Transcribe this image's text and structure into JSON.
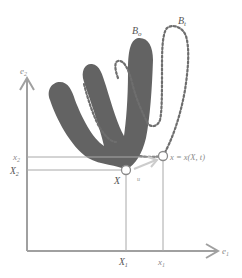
{
  "diagram": {
    "colors": {
      "body_fill": "#636363",
      "dotted": "#6e6e6e",
      "axis": "#a0a0a0",
      "guide": "#a8a8a8",
      "arrow": "#c8c8c8",
      "label": "#8a8a8a"
    },
    "axes": {
      "vertical_label": "e",
      "vertical_sub": "2",
      "horizontal_label": "e",
      "horizontal_sub": "1"
    },
    "bodies": {
      "reference": {
        "label": "B",
        "sub": "o"
      },
      "current": {
        "label": "B",
        "sub": "t"
      }
    },
    "points": {
      "reference": {
        "label": "X"
      },
      "current": {
        "label": "x = x(X, t)"
      }
    },
    "ticks": {
      "X1": {
        "label": "X",
        "sub": "1"
      },
      "x1": {
        "label": "x",
        "sub": "1"
      },
      "X2": {
        "label": "X",
        "sub": "2"
      },
      "x2": {
        "label": "x",
        "sub": "2"
      }
    },
    "displacement_label": "u"
  }
}
